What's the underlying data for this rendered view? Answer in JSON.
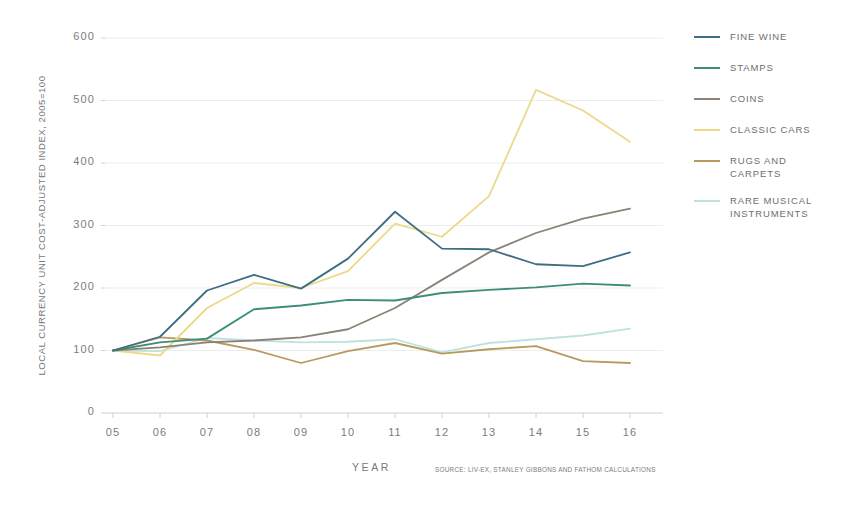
{
  "chart_data": {
    "type": "line",
    "title": "",
    "xlabel": "YEAR",
    "ylabel": "LOCAL CURRENCY UNIT  COST-ADJUSTED INDEX, 2005=100",
    "source": "SOURCE: LIV-EX, STANLEY GIBBONS AND FATHOM CALCULATIONS",
    "x": [
      "05",
      "06",
      "07",
      "08",
      "09",
      "10",
      "11",
      "12",
      "13",
      "14",
      "15",
      "16"
    ],
    "xlim": [
      2005,
      2016
    ],
    "ylim": [
      0,
      600
    ],
    "yticks": [
      0,
      100,
      200,
      300,
      400,
      500,
      600
    ],
    "grid": true,
    "legend_position": "right",
    "series": [
      {
        "name": "FINE WINE",
        "color": "#3e6e82",
        "values": [
          100,
          122,
          196,
          221,
          199,
          247,
          322,
          263,
          262,
          238,
          235,
          257
        ]
      },
      {
        "name": "STAMPS",
        "color": "#3d8c7c",
        "values": [
          100,
          113,
          119,
          166,
          172,
          181,
          180,
          192,
          197,
          201,
          207,
          204
        ]
      },
      {
        "name": "COINS",
        "color": "#8b8275",
        "values": [
          100,
          105,
          113,
          116,
          121,
          134,
          168,
          213,
          257,
          288,
          311,
          327
        ]
      },
      {
        "name": "CLASSIC CARS",
        "color": "#ecd98a",
        "values": [
          100,
          92,
          168,
          208,
          200,
          227,
          303,
          282,
          347,
          517,
          484,
          434
        ]
      },
      {
        "name": "RUGS AND\nCARPETS",
        "color": "#b89a5e",
        "values": [
          100,
          121,
          116,
          101,
          80,
          99,
          112,
          95,
          102,
          107,
          83,
          80
        ]
      },
      {
        "name": "RARE MUSICAL\nINSTRUMENTS",
        "color": "#bfe2e0",
        "values": [
          100,
          99,
          120,
          116,
          113,
          114,
          118,
          97,
          112,
          118,
          124,
          135
        ]
      }
    ]
  }
}
